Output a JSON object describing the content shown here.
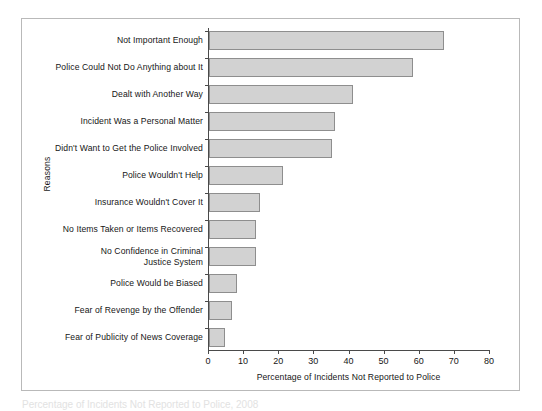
{
  "chart_data": {
    "type": "bar",
    "orientation": "horizontal",
    "title": "",
    "xlabel": "Percentage of Incidents Not Reported to Police",
    "ylabel": "Reasons",
    "xlim": [
      0,
      80
    ],
    "xticks": [
      0,
      10,
      20,
      30,
      40,
      50,
      60,
      70,
      80
    ],
    "grid": false,
    "legend": null,
    "categories": [
      "Not Important Enough",
      "Police Could Not Do Anything about It",
      "Dealt with Another Way",
      "Incident Was a Personal Matter",
      "Didn't Want to Get the Police Involved",
      "Police Wouldn't Help",
      "Insurance Wouldn't Cover It",
      "No Items Taken or Items Recovered",
      "No Confidence in Criminal\nJustice System",
      "Police Would be Biased",
      "Fear of Revenge by the Offender",
      "Fear of Publicity of News Coverage"
    ],
    "values": [
      67,
      58,
      41,
      36,
      35,
      21,
      14.5,
      13.5,
      13.5,
      8,
      6.5,
      4.5
    ],
    "bar_fill": "#d2d2d2",
    "bar_stroke": "#8e8e8e"
  },
  "caption": {
    "text": "Percentage of Incidents Not Reported to Police, 2008"
  }
}
